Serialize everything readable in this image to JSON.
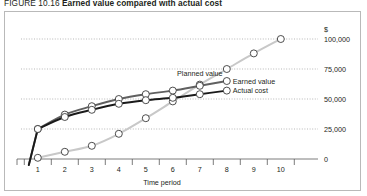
{
  "caption": {
    "figure_number": "FIGURE 10.16",
    "title": "Earned value compared with actual cost"
  },
  "axes": {
    "y_currency_symbol": "$",
    "x_axis_label": "Time period",
    "y_tick_labels": [
      "100,000",
      "75,000",
      "50,000",
      "25,000",
      "0"
    ],
    "x_tick_labels": [
      "1",
      "2",
      "3",
      "4",
      "5",
      "6",
      "7",
      "8",
      "9",
      "10"
    ]
  },
  "annotations": {
    "planned_value": "Planned value",
    "earned_value": "Earned value",
    "actual_cost": "Actual cost"
  },
  "colors": {
    "planned_value": "#c8c8c8",
    "earned_value": "#606060",
    "actual_cost": "#1a1a1a",
    "gridline": "#9a9a9a",
    "axis": "#5a5a5a",
    "marker_fill": "#ffffff",
    "frame_border": "#b9b9b9"
  },
  "chart_data": {
    "type": "line",
    "title": "Earned value compared with actual cost",
    "xlabel": "Time period",
    "ylabel": "$",
    "xlim": [
      0.6,
      10.6
    ],
    "ylim": [
      0,
      100000
    ],
    "yticks": [
      0,
      25000,
      50000,
      75000,
      100000
    ],
    "xticks": [
      1,
      2,
      3,
      4,
      5,
      6,
      7,
      8,
      9,
      10
    ],
    "grid": "horizontal-dotted",
    "legend": "inline-annotations",
    "series": [
      {
        "name": "Planned value",
        "color": "#c8c8c8",
        "marker": "open-circle",
        "x": [
          1,
          2,
          3,
          4,
          5,
          6,
          7,
          8,
          9,
          10
        ],
        "values": [
          1000,
          6000,
          11000,
          21000,
          34000,
          48000,
          62000,
          75000,
          88000,
          100000
        ]
      },
      {
        "name": "Earned value",
        "color": "#606060",
        "marker": "open-circle",
        "x": [
          1,
          2,
          3,
          4,
          5,
          6,
          7,
          8
        ],
        "values": [
          25000,
          37000,
          44000,
          50000,
          54000,
          57000,
          61000,
          65000
        ]
      },
      {
        "name": "Actual cost",
        "color": "#1a1a1a",
        "marker": "open-circle",
        "x": [
          1,
          2,
          3,
          4,
          5,
          6,
          7,
          8
        ],
        "values": [
          25000,
          35000,
          41000,
          46000,
          49000,
          51000,
          54000,
          57000
        ]
      }
    ]
  }
}
